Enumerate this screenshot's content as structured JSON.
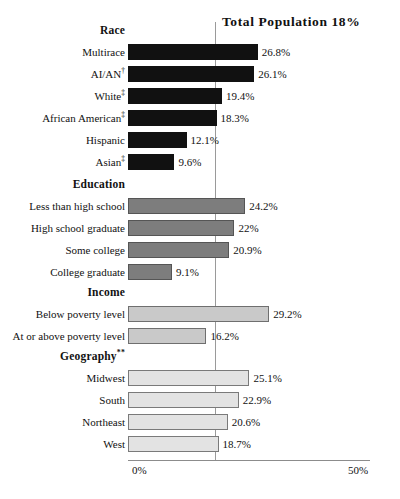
{
  "chart_data": {
    "type": "bar",
    "orientation": "horizontal",
    "title": "Total Population 18%",
    "xlabel": "",
    "ylabel": "",
    "xlim": [
      0,
      50
    ],
    "xticks": [
      "0%",
      "50%"
    ],
    "grid": false,
    "legend": null,
    "reference_line": {
      "label": "Total Population 18%",
      "value": 18
    },
    "groups": [
      {
        "name": "Race",
        "style": "black",
        "color": "#111111",
        "categories": [
          "Multirace",
          "AI/AN†",
          "White‡",
          "African American‡",
          "Hispanic",
          "Asian‡"
        ],
        "values": [
          26.8,
          26.1,
          19.4,
          18.3,
          12.1,
          9.6
        ],
        "labels": [
          "26.8%",
          "26.1%",
          "19.4%",
          "18.3%",
          "12.1%",
          "9.6%"
        ]
      },
      {
        "name": "Education",
        "style": "mid-gray",
        "color": "#7d7d7d",
        "categories": [
          "Less than high school",
          "High school graduate",
          "Some college",
          "College graduate"
        ],
        "values": [
          24.2,
          22.0,
          20.9,
          9.1
        ],
        "labels": [
          "24.2%",
          "22%",
          "20.9%",
          "9.1%"
        ]
      },
      {
        "name": "Income",
        "style": "light-gray",
        "color": "#c9c9c9",
        "categories": [
          "Below poverty level",
          "At or above poverty level"
        ],
        "values": [
          29.2,
          16.2
        ],
        "labels": [
          "29.2%",
          "16.2%"
        ]
      },
      {
        "name": "Geography**",
        "style": "lightest-gray",
        "color": "#e3e3e3",
        "categories": [
          "Midwest",
          "South",
          "Northeast",
          "West"
        ],
        "values": [
          25.1,
          22.9,
          20.6,
          18.7
        ],
        "labels": [
          "25.1%",
          "22.9%",
          "20.6%",
          "18.7%"
        ]
      }
    ]
  },
  "axis": {
    "min_label": "0%",
    "max_label": "50%"
  }
}
